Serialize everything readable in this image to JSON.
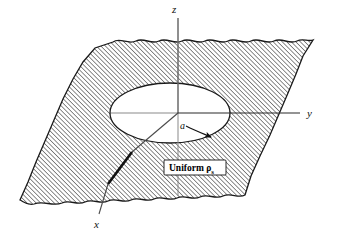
{
  "figure": {
    "background_color": "#ffffff",
    "line_color": "#1a1a1a",
    "hatch_color": "#3a3a3a",
    "hole_fill": "#ffffff"
  },
  "axes": {
    "z": {
      "label": "z",
      "direction": "vertical-up"
    },
    "y": {
      "label": "y",
      "direction": "right"
    },
    "x": {
      "label": "x",
      "direction": "lower-left-toward-viewer"
    }
  },
  "annotations": {
    "radius": {
      "label": "a",
      "description": "radius of circular hole"
    },
    "density": {
      "text": "Uniform ",
      "symbol": "ρ",
      "subscript": "s",
      "full": "Uniform ρs"
    }
  },
  "geometry": {
    "plane_shape": "parallelogram-with-wavy-torn-edges",
    "hole_shape": "ellipse-perspective-circle",
    "hatching": {
      "angle_deg": 45,
      "spacing_px": 2.6
    }
  }
}
